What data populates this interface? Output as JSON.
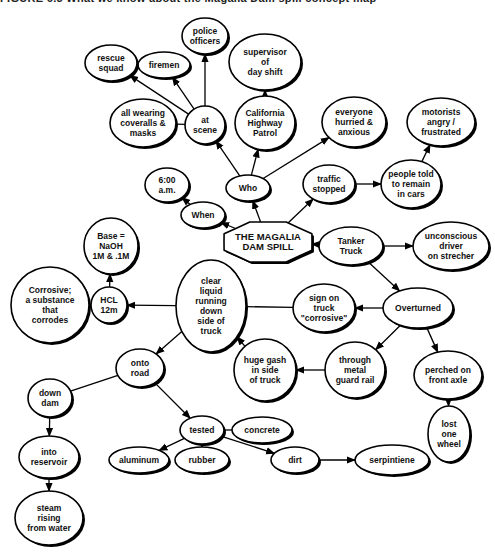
{
  "header": {
    "title": "FIGURE 6.3   What we know about the Magalia Dam spill concept map"
  },
  "diagram": {
    "type": "concept-map",
    "central": {
      "id": "spill",
      "label": [
        "THE MAGALIA",
        "DAM SPILL"
      ]
    },
    "nodes": [
      {
        "id": "spill",
        "label": [
          "THE MAGALIA",
          "DAM SPILL"
        ],
        "x": 268,
        "y": 242,
        "rx": 44,
        "ry": 20,
        "shape": "cloud"
      },
      {
        "id": "who",
        "label": [
          "Who"
        ],
        "x": 248,
        "y": 188,
        "rx": 22,
        "ry": 13
      },
      {
        "id": "when",
        "label": [
          "When"
        ],
        "x": 203,
        "y": 215,
        "rx": 22,
        "ry": 13
      },
      {
        "id": "six",
        "label": [
          "6:00",
          "a.m."
        ],
        "x": 167,
        "y": 185,
        "rx": 22,
        "ry": 17
      },
      {
        "id": "atscene",
        "label": [
          "at",
          "scene"
        ],
        "x": 205,
        "y": 125,
        "rx": 20,
        "ry": 19
      },
      {
        "id": "police",
        "label": [
          "police",
          "officers"
        ],
        "x": 205,
        "y": 36,
        "rx": 23,
        "ry": 18
      },
      {
        "id": "firemen",
        "label": [
          "firemen"
        ],
        "x": 164,
        "y": 65,
        "rx": 26,
        "ry": 13
      },
      {
        "id": "rescue",
        "label": [
          "rescue",
          "squad"
        ],
        "x": 111,
        "y": 63,
        "rx": 26,
        "ry": 18
      },
      {
        "id": "coveralls",
        "label": [
          "all wearing",
          "coveralls &",
          "masks"
        ],
        "x": 143,
        "y": 123,
        "rx": 33,
        "ry": 24
      },
      {
        "id": "chp",
        "label": [
          "California",
          "Highway",
          "Patrol"
        ],
        "x": 265,
        "y": 123,
        "rx": 30,
        "ry": 27
      },
      {
        "id": "supervisor",
        "label": [
          "supervisor",
          "of",
          "day shift"
        ],
        "x": 265,
        "y": 62,
        "rx": 36,
        "ry": 28
      },
      {
        "id": "everyone",
        "label": [
          "everyone",
          "hurried &",
          "anxious"
        ],
        "x": 354,
        "y": 122,
        "rx": 32,
        "ry": 25
      },
      {
        "id": "traffic",
        "label": [
          "traffic",
          "stopped"
        ],
        "x": 329,
        "y": 184,
        "rx": 26,
        "ry": 19
      },
      {
        "id": "people",
        "label": [
          "people told",
          "to remain",
          "in cars"
        ],
        "x": 411,
        "y": 184,
        "rx": 30,
        "ry": 24
      },
      {
        "id": "motorists",
        "label": [
          "motorists",
          "angry /",
          "frustrated"
        ],
        "x": 441,
        "y": 122,
        "rx": 34,
        "ry": 24
      },
      {
        "id": "tanker",
        "label": [
          "Tanker",
          "Truck"
        ],
        "x": 351,
        "y": 246,
        "rx": 32,
        "ry": 19
      },
      {
        "id": "unconscious",
        "label": [
          "unconscious",
          "driver",
          "on strecher"
        ],
        "x": 451,
        "y": 246,
        "rx": 38,
        "ry": 24
      },
      {
        "id": "overturned",
        "label": [
          "Overturned"
        ],
        "x": 418,
        "y": 308,
        "rx": 35,
        "ry": 20
      },
      {
        "id": "sign",
        "label": [
          "sign on",
          "truck",
          "\"corrosive\""
        ],
        "x": 324,
        "y": 308,
        "rx": 31,
        "ry": 24
      },
      {
        "id": "clear",
        "label": [
          "clear",
          "liquid",
          "running",
          "down",
          "side of",
          "truck"
        ],
        "x": 211,
        "y": 306,
        "rx": 35,
        "ry": 46
      },
      {
        "id": "hcl",
        "label": [
          "HCL",
          "12m"
        ],
        "x": 109,
        "y": 305,
        "rx": 18,
        "ry": 18
      },
      {
        "id": "base",
        "label": [
          "Base =",
          "NaOH",
          "1M & .1M"
        ],
        "x": 111,
        "y": 246,
        "rx": 27,
        "ry": 28
      },
      {
        "id": "corrosive",
        "label": [
          "Corrosive;",
          "a substance",
          "that",
          "corrodes"
        ],
        "x": 50,
        "y": 305,
        "rx": 39,
        "ry": 38
      },
      {
        "id": "gash",
        "label": [
          "huge gash",
          "in side",
          "of truck"
        ],
        "x": 265,
        "y": 370,
        "rx": 31,
        "ry": 31
      },
      {
        "id": "through",
        "label": [
          "through",
          "metal",
          "guard rail"
        ],
        "x": 355,
        "y": 370,
        "rx": 30,
        "ry": 28
      },
      {
        "id": "perched",
        "label": [
          "perched on",
          "front axle"
        ],
        "x": 448,
        "y": 375,
        "rx": 34,
        "ry": 24
      },
      {
        "id": "lostwheel",
        "label": [
          "lost",
          "one",
          "wheel"
        ],
        "x": 449,
        "y": 434,
        "rx": 21,
        "ry": 28
      },
      {
        "id": "onto",
        "label": [
          "onto",
          "road"
        ],
        "x": 140,
        "y": 368,
        "rx": 24,
        "ry": 19
      },
      {
        "id": "downdam",
        "label": [
          "down",
          "dam"
        ],
        "x": 50,
        "y": 398,
        "rx": 22,
        "ry": 19
      },
      {
        "id": "reservoir",
        "label": [
          "into",
          "reservoir"
        ],
        "x": 49,
        "y": 457,
        "rx": 30,
        "ry": 21
      },
      {
        "id": "steam",
        "label": [
          "steam",
          "rising",
          "from water"
        ],
        "x": 49,
        "y": 518,
        "rx": 34,
        "ry": 27
      },
      {
        "id": "tested",
        "label": [
          "tested"
        ],
        "x": 202,
        "y": 430,
        "rx": 22,
        "ry": 14
      },
      {
        "id": "concrete",
        "label": [
          "concrete"
        ],
        "x": 262,
        "y": 430,
        "rx": 30,
        "ry": 13
      },
      {
        "id": "aluminum",
        "label": [
          "aluminum"
        ],
        "x": 139,
        "y": 460,
        "rx": 30,
        "ry": 13
      },
      {
        "id": "rubber",
        "label": [
          "rubber"
        ],
        "x": 202,
        "y": 460,
        "rx": 27,
        "ry": 13
      },
      {
        "id": "dirt",
        "label": [
          "dirt"
        ],
        "x": 295,
        "y": 460,
        "rx": 24,
        "ry": 13
      },
      {
        "id": "serpentine",
        "label": [
          "serpintiene"
        ],
        "x": 392,
        "y": 460,
        "rx": 37,
        "ry": 15
      }
    ],
    "edges": [
      {
        "from": "spill",
        "to": "who",
        "arrow": true
      },
      {
        "from": "spill",
        "to": "when",
        "arrow": true
      },
      {
        "from": "spill",
        "to": "traffic",
        "arrow": true
      },
      {
        "from": "tanker",
        "to": "spill",
        "arrow": true
      },
      {
        "from": "when",
        "to": "six",
        "arrow": true
      },
      {
        "from": "who",
        "to": "atscene",
        "arrow": true
      },
      {
        "from": "who",
        "to": "chp",
        "arrow": true
      },
      {
        "from": "who",
        "to": "everyone",
        "arrow": true
      },
      {
        "from": "chp",
        "to": "supervisor",
        "arrow": true
      },
      {
        "from": "atscene",
        "to": "police",
        "arrow": true
      },
      {
        "from": "atscene",
        "to": "firemen",
        "arrow": true
      },
      {
        "from": "atscene",
        "to": "rescue",
        "arrow": true
      },
      {
        "from": "atscene",
        "to": "coveralls",
        "arrow": false
      },
      {
        "from": "traffic",
        "to": "people",
        "arrow": true
      },
      {
        "from": "people",
        "to": "motorists",
        "arrow": true
      },
      {
        "from": "tanker",
        "to": "unconscious",
        "arrow": true
      },
      {
        "from": "tanker",
        "to": "overturned",
        "arrow": true
      },
      {
        "from": "overturned",
        "to": "sign",
        "arrow": true
      },
      {
        "from": "overturned",
        "to": "through",
        "arrow": true
      },
      {
        "from": "overturned",
        "to": "perched",
        "arrow": true
      },
      {
        "from": "perched",
        "to": "lostwheel",
        "arrow": true
      },
      {
        "from": "through",
        "to": "gash",
        "arrow": true
      },
      {
        "from": "gash",
        "to": "clear",
        "arrow": true
      },
      {
        "from": "sign",
        "to": "clear",
        "arrow": false
      },
      {
        "from": "clear",
        "to": "hcl",
        "arrow": true
      },
      {
        "from": "hcl",
        "to": "base",
        "arrow": true
      },
      {
        "from": "hcl",
        "to": "corrosive",
        "arrow": false
      },
      {
        "from": "clear",
        "to": "onto",
        "arrow": true
      },
      {
        "from": "onto",
        "to": "downdam",
        "arrow": false
      },
      {
        "from": "onto",
        "to": "tested",
        "arrow": true
      },
      {
        "from": "downdam",
        "to": "reservoir",
        "arrow": true
      },
      {
        "from": "reservoir",
        "to": "steam",
        "arrow": true
      },
      {
        "from": "tested",
        "to": "concrete",
        "arrow": false
      },
      {
        "from": "tested",
        "to": "aluminum",
        "arrow": true
      },
      {
        "from": "tested",
        "to": "rubber",
        "arrow": true
      },
      {
        "from": "tested",
        "to": "dirt",
        "arrow": true
      },
      {
        "from": "dirt",
        "to": "serpentine",
        "arrow": true
      }
    ]
  }
}
